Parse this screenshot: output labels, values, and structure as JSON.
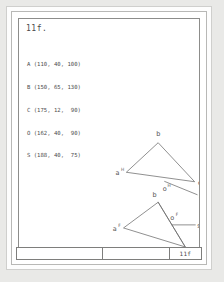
{
  "sheet": {
    "title": "11f.",
    "points_header": "",
    "points": [
      "A (110, 40, 100)",
      "B (150, 65, 130)",
      "C (175, 12,  90)",
      "O (162, 40,  90)",
      "S (188, 40,  75)"
    ]
  },
  "figures": {
    "horizontal_projection": {
      "name": "horizontal projection",
      "vertices": {
        "a": {
          "label": "a",
          "sup": "H",
          "x": 122,
          "y": 166
        },
        "b": {
          "label": "b",
          "sup": "",
          "x": 155,
          "y": 137
        },
        "c": {
          "label": "c",
          "sup": "",
          "x": 193,
          "y": 176
        }
      },
      "center": {
        "label": "o",
        "sup": "H",
        "x": 163,
        "y": 181
      },
      "ray_end": {
        "label": "s",
        "sup": "",
        "x": 197,
        "y": 190
      }
    },
    "frontal_projection": {
      "name": "frontal projection",
      "vertices": {
        "a": {
          "label": "a",
          "sup": "F",
          "x": 110,
          "y": 222
        },
        "b": {
          "label": "b",
          "sup": "",
          "x": 155,
          "y": 199
        },
        "c": {
          "label": "c",
          "sup": "",
          "x": 182,
          "y": 244
        }
      },
      "center": {
        "label": "o",
        "sup": "F",
        "x": 172,
        "y": 214
      },
      "ray_end": {
        "label": "s",
        "sup": "",
        "x": 197,
        "y": 221
      }
    }
  },
  "title_block": {
    "left_cell": "",
    "mid_cell": "",
    "right_cell": "11f"
  },
  "colors": {
    "line": "#6a6a6a",
    "text": "#4c4c4c",
    "frame": "#8d8d8b",
    "page": "#ffffff"
  }
}
